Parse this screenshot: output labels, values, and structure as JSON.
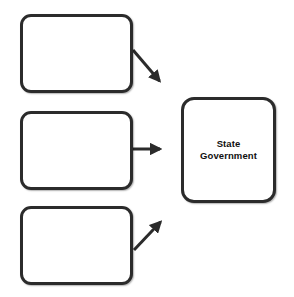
{
  "diagram": {
    "type": "flow-diagram",
    "canvas": {
      "width": 294,
      "height": 297,
      "background": "#ffffff"
    },
    "style": {
      "stroke_color": "#2b2b2b",
      "stroke_width": 3,
      "node_fill": "#ffffff",
      "text_color": "#101010",
      "corner_radius": 11
    },
    "nodes": [
      {
        "id": "source-1",
        "label": "",
        "x": 20,
        "y": 14,
        "width": 113,
        "height": 79,
        "filled": false
      },
      {
        "id": "source-2",
        "label": "",
        "x": 20,
        "y": 111,
        "width": 113,
        "height": 79,
        "filled": false
      },
      {
        "id": "source-3",
        "label": "",
        "x": 20,
        "y": 206,
        "width": 113,
        "height": 79,
        "filled": false
      },
      {
        "id": "state-government",
        "label": "State\nGovernment",
        "x": 181,
        "y": 97,
        "width": 95,
        "height": 106,
        "filled": false
      }
    ],
    "connectors": [
      {
        "id": "arrow-source-1-to-state-government",
        "from": "source-1",
        "to": "state-government",
        "direction": "down-right",
        "x1": 133,
        "y1": 50,
        "x2": 162,
        "y2": 84,
        "arrowhead": "end"
      },
      {
        "id": "arrow-source-2-to-state-government",
        "from": "source-2",
        "to": "state-government",
        "direction": "right",
        "x1": 133,
        "y1": 149,
        "x2": 163,
        "y2": 149,
        "arrowhead": "end"
      },
      {
        "id": "arrow-source-3-to-state-government",
        "from": "source-3",
        "to": "state-government",
        "direction": "up-right",
        "x1": 134,
        "y1": 250,
        "x2": 163,
        "y2": 219,
        "arrowhead": "end"
      }
    ]
  }
}
